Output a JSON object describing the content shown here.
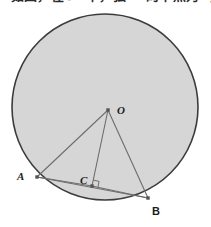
{
  "screenshot": {
    "width": 211,
    "height": 227,
    "background_color": "#ffffff"
  },
  "top_text": {
    "note": "row of text clipped at the top edge; only the lower few pixels are rendered",
    "content": "如图，在⊙O中，弦AB的中点为C，连接OC。"
  },
  "figure": {
    "type": "circle-geometry-diagram",
    "colors": {
      "circle_fill": "#d6d6d6",
      "circle_stroke": "#3c3c3c",
      "segment_line": "#6d6d6d",
      "point_fill": "#555555",
      "label_color": "#1c1c1c",
      "right_angle_mark": "#6d6d6d"
    },
    "circle": {
      "label": "circle-O",
      "center_x": 105,
      "center_y": 107,
      "radius": 93,
      "stroke_width": 1.6
    },
    "points": [
      {
        "id": "O",
        "label": "O",
        "x": 108,
        "y": 110,
        "label_x": 117,
        "label_y": 114,
        "italic": true
      },
      {
        "id": "A",
        "label": "A",
        "x": 37,
        "y": 177,
        "label_x": 17,
        "label_y": 180,
        "italic": true
      },
      {
        "id": "C",
        "label": "C",
        "x": 92,
        "y": 186,
        "label_x": 80,
        "label_y": 184,
        "italic": true
      },
      {
        "id": "B",
        "label": "B",
        "x": 148,
        "y": 198,
        "label_x": 152,
        "label_y": 215,
        "italic": false
      }
    ],
    "segments": [
      {
        "id": "OA",
        "from": "O",
        "to": "A"
      },
      {
        "id": "OC",
        "from": "O",
        "to": "C"
      },
      {
        "id": "OB",
        "from": "O",
        "to": "B"
      },
      {
        "id": "AB",
        "from": "A",
        "to": "B"
      },
      {
        "id": "AC",
        "from": "A",
        "to": "C"
      },
      {
        "id": "CB",
        "from": "C",
        "to": "B"
      }
    ],
    "right_angle": {
      "at_point": "C",
      "between": [
        "OC",
        "CB"
      ],
      "marker_size": 6
    }
  }
}
